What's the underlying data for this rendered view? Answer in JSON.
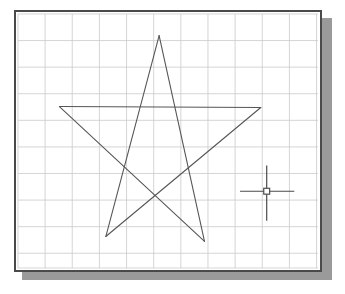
{
  "app": {
    "title": "CAD Drawing Area",
    "window_label": "drawing-window",
    "background_color": "#ffffff",
    "frame_color": "#4a4a4a",
    "shadow_color": "#9a9a9a"
  },
  "canvas": {
    "width": 304,
    "height": 258,
    "origin_x": 16,
    "origin_y": 12
  },
  "grid": {
    "visible": true,
    "label": "drawing-grid",
    "spacing_x": 27.5,
    "spacing_y": 27.0,
    "color": "#c9c9c9",
    "line_width": 0.8,
    "vertical_lines": [
      16,
      43.5,
      71,
      98.5,
      126,
      153.5,
      181,
      208.5,
      236,
      263.5,
      291,
      318.5
    ],
    "horizontal_lines": [
      12,
      39,
      66,
      93,
      120,
      147,
      174,
      201,
      228,
      255,
      270
    ]
  },
  "geometry": {
    "label": "pentagram-star",
    "type": "polyline",
    "stroke_color": "#555555",
    "stroke_width": 1.1,
    "closed": true,
    "vertices": [
      {
        "name": "top-apex",
        "x": 159,
        "y": 34
      },
      {
        "name": "bottom-right-point",
        "x": 205,
        "y": 243
      },
      {
        "name": "left-point",
        "x": 58,
        "y": 106
      },
      {
        "name": "right-point",
        "x": 262,
        "y": 107
      },
      {
        "name": "bottom-left-point",
        "x": 105,
        "y": 238
      }
    ],
    "segments": [
      {
        "from": "top-apex",
        "to": "bottom-right-point"
      },
      {
        "from": "bottom-right-point",
        "to": "left-point"
      },
      {
        "from": "left-point",
        "to": "right-point"
      },
      {
        "from": "right-point",
        "to": "bottom-left-point"
      },
      {
        "from": "bottom-left-point",
        "to": "top-apex"
      }
    ]
  },
  "cursor": {
    "label": "crosshair-cursor",
    "center_x": 268,
    "center_y": 192,
    "horizontal_start_x": 241,
    "horizontal_end_x": 296,
    "vertical_start_y": 166,
    "vertical_end_y": 222,
    "stroke_color": "#4a4a4a",
    "stroke_width": 1.2,
    "pickbox_size": 6,
    "pickbox_color": "#4a4a4a"
  }
}
